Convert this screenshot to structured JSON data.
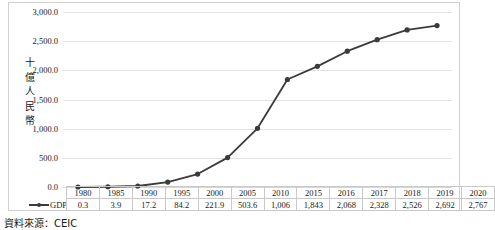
{
  "chart_data": {
    "type": "line",
    "title": "",
    "xlabel": "",
    "ylabel": "十億人民幣",
    "ylim": [
      0,
      3000
    ],
    "ytick_step": 500,
    "ytick_labels": [
      "0.0",
      "500.0",
      "1,000.0",
      "1,500.0",
      "2,000.0",
      "2,500.0",
      "3,000.0"
    ],
    "ytick_values": [
      0,
      500,
      1000,
      1500,
      2000,
      2500,
      3000
    ],
    "grid": true,
    "legend_position": "data-table-row",
    "categories": [
      "1980",
      "1985",
      "1990",
      "1995",
      "2000",
      "2005",
      "2010",
      "2015",
      "2016",
      "2017",
      "2018",
      "2019",
      "2020"
    ],
    "series": [
      {
        "name": "GDP",
        "values": [
          0.3,
          3.9,
          17.2,
          84.2,
          221.9,
          503.6,
          1006,
          1843,
          2068,
          2328,
          2526,
          2692,
          2767
        ],
        "labels": [
          "0.3",
          "3.9",
          "17.2",
          "84.2",
          "221.9",
          "503.6",
          "1,006",
          "1,843",
          "2,068",
          "2,328",
          "2,526",
          "2,692",
          "2,767"
        ],
        "color": "#3b3b3b",
        "marker": "circle"
      }
    ],
    "data_table": {
      "row_header_blank": "",
      "legend_label": "GDP",
      "header_row": [
        "1980",
        "1985",
        "1990",
        "1995",
        "2000",
        "2005",
        "2010",
        "2015",
        "2016",
        "2017",
        "2018",
        "2019",
        "2020"
      ],
      "value_row": [
        "0.3",
        "3.9",
        "17.2",
        "84.2",
        "221.9",
        "503.6",
        "1,006",
        "1,843",
        "2,068",
        "2,328",
        "2,526",
        "2,692",
        "2,767"
      ]
    }
  },
  "axis_title": {
    "chars": [
      "十",
      "億",
      "人",
      "民",
      "幣"
    ]
  },
  "caption": {
    "source_text": "資料來源：CEIC"
  },
  "colors": {
    "series": "#3b3b3b",
    "gridline": "#e2e2e2",
    "frame": "#d0d0d0",
    "table_border": "#c9c9c9",
    "text": "#1a1a1a"
  }
}
